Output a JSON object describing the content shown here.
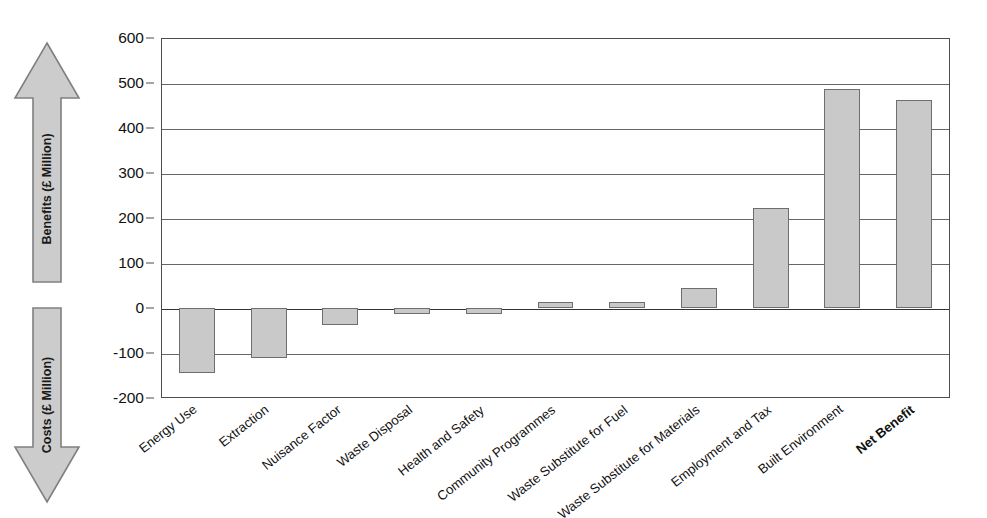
{
  "axes": {
    "benefits_arrow_label": "Benefits (£ Million)",
    "costs_arrow_label": "Costs (£ Million)",
    "y_ticks": [
      "600",
      "500",
      "400",
      "300",
      "200",
      "100",
      "0",
      "-100",
      "-200"
    ]
  },
  "colors": {
    "bar_fill": "#c9c9c9",
    "bar_border": "#6e6e6e",
    "arrow_fill": "#cccccc",
    "arrow_border": "#808080",
    "gridline": "#666666",
    "text": "#111111"
  },
  "chart_data": {
    "type": "bar",
    "title": "",
    "xlabel": "",
    "ylabel": "£ Million",
    "ylim": [
      -200,
      600
    ],
    "ytick_step": 100,
    "grid": true,
    "legend": null,
    "categories": [
      "Energy Use",
      "Extraction",
      "Nuisance Factor",
      "Waste Disposal",
      "Health and Safety",
      "Community Programmes",
      "Waste Substitute for Fuel",
      "Waste Substitute for Materials",
      "Employment and Tax",
      "Built Environment",
      "Net Benefit"
    ],
    "values": [
      -145,
      -110,
      -38,
      -13,
      -14,
      13,
      13,
      44,
      222,
      486,
      462
    ],
    "emphasis_index": 10,
    "annotations": [
      "Benefits (£ Million)",
      "Costs (£ Million)"
    ]
  }
}
